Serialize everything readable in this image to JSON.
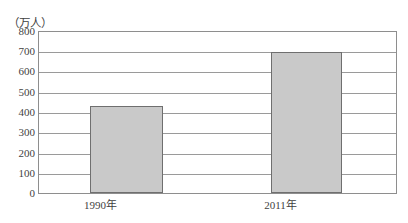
{
  "chart_data": {
    "type": "bar",
    "title": "",
    "subtitle": "",
    "xlabel": "",
    "ylabel": "（万人）",
    "unit_caption": "（万人）",
    "categories": [
      "1990年",
      "2011年"
    ],
    "values": [
      430,
      700
    ],
    "series": [
      {
        "name": "",
        "values": [
          430,
          700
        ]
      }
    ],
    "ylim": [
      0,
      800
    ],
    "y_ticks": [
      0,
      100,
      200,
      300,
      400,
      500,
      600,
      700,
      800
    ],
    "y_tick_labels": [
      "0",
      "100",
      "200",
      "300",
      "400",
      "500",
      "600",
      "700",
      "800"
    ],
    "grid": true,
    "legend": false,
    "legend_position": "none",
    "bar_fill_color": "#c9c9c9",
    "bar_border_color": "#6f6f6f",
    "grid_color": "#9a9a9a",
    "frame_color": "#8e8e8e",
    "text_color": "#3f3f3f",
    "annotations": []
  }
}
